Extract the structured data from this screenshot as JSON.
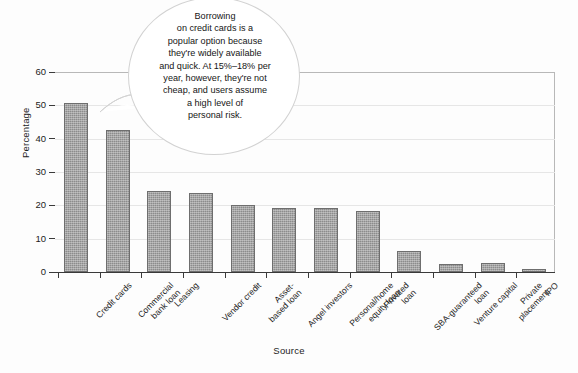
{
  "chart_data": {
    "type": "bar",
    "title": "",
    "subtitle": "",
    "xlabel": "Source",
    "ylabel": "Percentage",
    "ylim": [
      0,
      60
    ],
    "yticks": [
      0,
      10,
      20,
      30,
      40,
      50,
      60
    ],
    "grid": true,
    "legend": null,
    "orientation": "vertical",
    "bar_color": "#8c8c8c",
    "categories": [
      "Credit cards",
      "Commercial bank loan",
      "Leasing",
      "Vendor credit",
      "Asset-based loan",
      "Angel investors",
      "Personal/home equity loan",
      "Privated loan",
      "SBA-guaranteed loan",
      "Venture capital",
      "Private placement",
      "IPO"
    ],
    "category_lines": [
      [
        "Credit cards"
      ],
      [
        "Commercial",
        "bank loan"
      ],
      [
        "Leasing"
      ],
      [
        "Vendor credit"
      ],
      [
        "Asset-",
        "based loan"
      ],
      [
        "Angel investors"
      ],
      [
        "Personal/home",
        "equity loan"
      ],
      [
        "Privated",
        "loan"
      ],
      [
        "SBA-guaranteed",
        "loan"
      ],
      [
        "Venture capital"
      ],
      [
        "Private",
        "placement"
      ],
      [
        "IPO"
      ]
    ],
    "values": [
      50.7,
      42.5,
      24.4,
      23.8,
      20.2,
      19.2,
      19.2,
      18.3,
      6.3,
      2.3,
      2.8,
      1.0
    ],
    "annotations": [
      {
        "name": "credit-cards-callout",
        "shape": "circle",
        "target_category": "Credit cards",
        "text": "Borrowing on credit cards is a popular option because they're widely available and quick. At 15%–18% per year, however, they're not cheap, and users assume a high level of personal risk.",
        "lines": [
          "Borrowing",
          "on credit cards is a",
          "popular option because",
          "they're widely available",
          "and quick. At 15%–18% per",
          "year, however, they're not",
          "cheap, and users assume",
          "a high level of",
          "personal risk."
        ]
      }
    ]
  },
  "colors": {
    "bar_fill": "#8c8c8c",
    "bar_stroke": "#6e6e6e",
    "axis": "#3a3a3a",
    "gridline": "#e6e6e6",
    "frame": "#b8b8b8",
    "text": "#1c1c1c",
    "callout_bg": "#ffffff",
    "callout_border": "#d2d2d2",
    "background": "#fdfdfd"
  }
}
